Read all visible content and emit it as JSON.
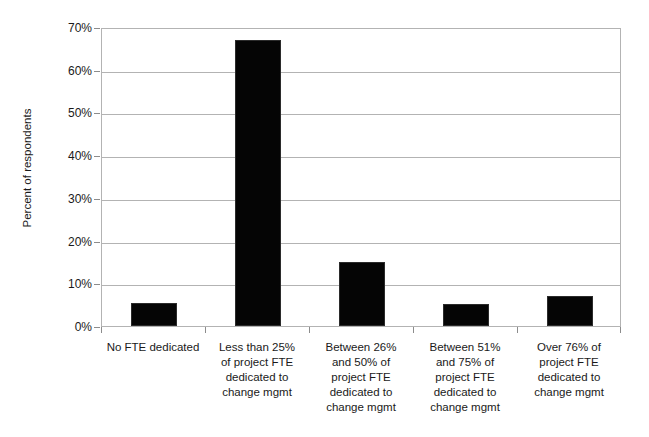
{
  "chart_data": {
    "type": "bar",
    "title": "",
    "xlabel": "",
    "ylabel": "Percent of respondents",
    "ylim": [
      0,
      70
    ],
    "ytick_values": [
      0,
      10,
      20,
      30,
      40,
      50,
      60,
      70
    ],
    "ytick_labels": [
      "0%",
      "10%",
      "20%",
      "30%",
      "40%",
      "50%",
      "60%",
      "70%"
    ],
    "grid": true,
    "legend": false,
    "bar_color": "#050505",
    "gridline_color": "#b3b3b3",
    "categories": [
      "No FTE dedicated",
      "Less than 25% of project FTE dedicated to change mgmt",
      "Between 26% and 50% of project FTE dedicated to change mgmt",
      "Between 51% and 75% of project FTE dedicated to change mgmt",
      "Over 76% of project FTE dedicated to change mgmt"
    ],
    "category_lines": [
      [
        "No FTE dedicated"
      ],
      [
        "Less than 25%",
        "of project FTE",
        "dedicated to",
        "change mgmt"
      ],
      [
        "Between 26%",
        "and 50% of",
        "project FTE",
        "dedicated to",
        "change mgmt"
      ],
      [
        "Between 51%",
        "and 75% of",
        "project FTE",
        "dedicated to",
        "change mgmt"
      ],
      [
        "Over 76% of",
        "project FTE",
        "dedicated to",
        "change mgmt"
      ]
    ],
    "values": [
      5.4,
      67.0,
      15.0,
      5.2,
      7.0
    ]
  }
}
